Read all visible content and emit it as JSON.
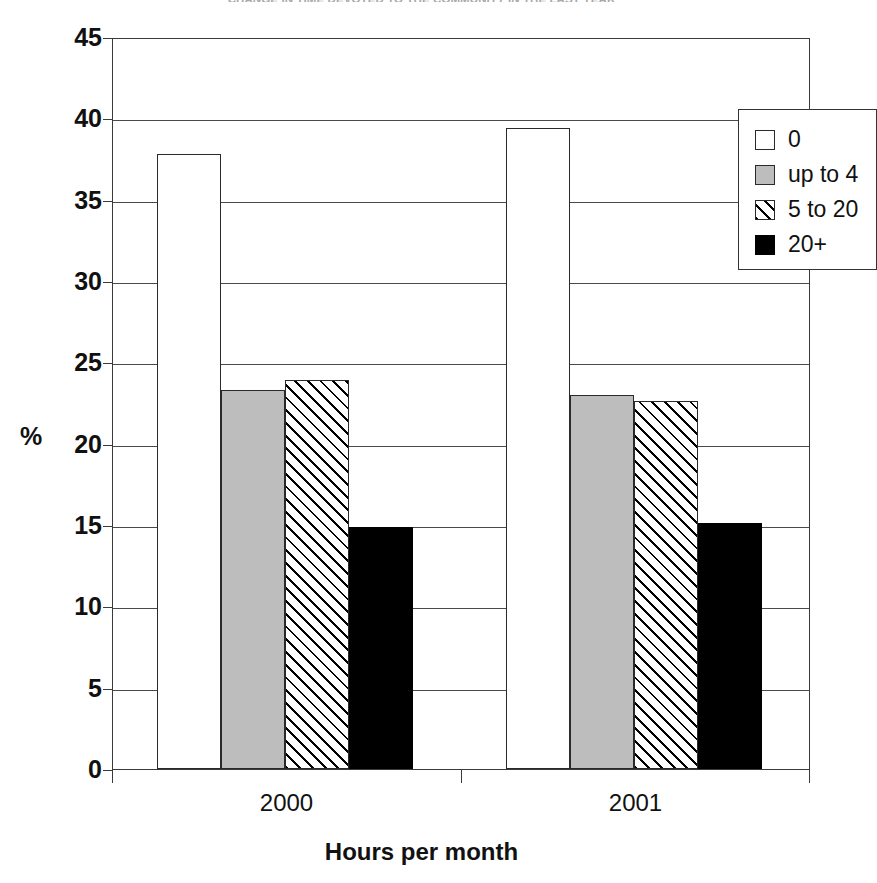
{
  "chart_data": {
    "type": "bar",
    "title": "CHANGE IN TIME DEVOTED TO THE COMMUNITY IN THE LAST YEAR",
    "xlabel": "Hours per month",
    "ylabel": "%",
    "categories": [
      "2000",
      "2001"
    ],
    "series": [
      {
        "name": "0",
        "values": [
          37.8,
          39.4
        ],
        "fill": "white"
      },
      {
        "name": "up to 4",
        "values": [
          23.3,
          23.0
        ],
        "fill": "gray"
      },
      {
        "name": "5 to 20",
        "values": [
          23.9,
          22.6
        ],
        "fill": "hatch"
      },
      {
        "name": "20+",
        "values": [
          14.9,
          15.1
        ],
        "fill": "black"
      }
    ],
    "ylim": [
      0,
      45
    ],
    "ytick_step": 5,
    "yticks": [
      "45",
      "40",
      "35",
      "30",
      "25",
      "20",
      "15",
      "10",
      "5",
      "0"
    ],
    "grid": true,
    "grid_axis": "y",
    "legend_position": "top-right",
    "legend_entries": [
      "0",
      "up to 4",
      "5 to 20",
      "20+"
    ],
    "colors": {
      "white": "#ffffff",
      "gray": "#bdbdbd",
      "hatch": "#ffffff",
      "black": "#000000",
      "axis": "#3a3a3a",
      "text": "#111111"
    }
  }
}
